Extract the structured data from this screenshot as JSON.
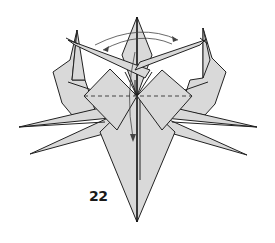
{
  "diagram": {
    "type": "origami-instruction",
    "step_number": "22",
    "colors": {
      "paper_fill": "#d9d9d9",
      "outline": "#222222",
      "background": "#ffffff"
    },
    "elements": {
      "top_point": "central vertical point",
      "left_ear": "raised flap upper-left",
      "right_ear": "raised flap upper-right",
      "left_diamond": "left square flap with valley fold",
      "right_diamond": "right square flap with valley fold",
      "crossed_flaps": "two long flaps crossing at top",
      "left_legs": 2,
      "right_legs": 2,
      "bottom_point": "long downward point"
    },
    "annotations": {
      "fold_line": "horizontal dashed valley fold across diamonds",
      "swing_arrow": "double-headed curved arrow across top",
      "fold_down_arrow": "curved arrow from top down to center-bottom"
    }
  }
}
